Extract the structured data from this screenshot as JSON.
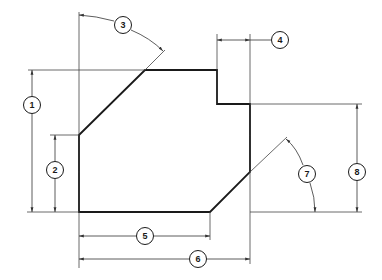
{
  "drawing": {
    "colors": {
      "outline": "#1a1a1a",
      "dimension": "#333333",
      "background": "#ffffff"
    },
    "callouts": [
      {
        "id": "1",
        "label": "1",
        "x": 32,
        "y": 105,
        "type": "linear-vertical"
      },
      {
        "id": "2",
        "label": "2",
        "x": 55,
        "y": 170,
        "type": "linear-vertical"
      },
      {
        "id": "3",
        "label": "3",
        "x": 123,
        "y": 25,
        "type": "angular"
      },
      {
        "id": "4",
        "label": "4",
        "x": 280,
        "y": 40,
        "type": "linear-horizontal"
      },
      {
        "id": "5",
        "label": "5",
        "x": 145,
        "y": 236,
        "type": "linear-horizontal"
      },
      {
        "id": "6",
        "label": "6",
        "x": 198,
        "y": 259,
        "type": "linear-horizontal"
      },
      {
        "id": "7",
        "label": "7",
        "x": 307,
        "y": 174,
        "type": "angular"
      },
      {
        "id": "8",
        "label": "8",
        "x": 357,
        "y": 172,
        "type": "linear-vertical"
      }
    ]
  }
}
